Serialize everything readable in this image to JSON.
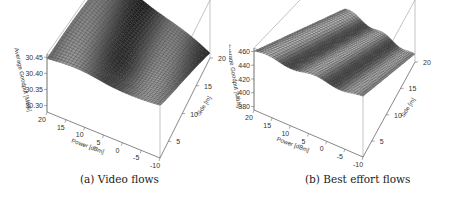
{
  "captions": {
    "a": "(a) Video flows",
    "b": "(b) Best effort flows"
  },
  "chart_data": [
    {
      "type": "surface3d",
      "title": "(a) Video flows",
      "xlabel": "Power [dBm]",
      "ylabel": "Side [m]",
      "zlabel": "Average Goodput [Mb/s]",
      "x_ticks": [
        20,
        15,
        10,
        5,
        0,
        -5,
        -10
      ],
      "y_ticks": [
        5,
        10,
        15,
        20
      ],
      "z_ticks": [
        30.3,
        30.35,
        30.4,
        30.45
      ],
      "xlim": [
        -10,
        20
      ],
      "ylim": [
        2,
        20
      ],
      "zlim": [
        30.28,
        30.46
      ],
      "description": "Surface is near 30.45 at high power / small side, with a wavy depression in the middle, dropping toward ~30.28 at low power and large side."
    },
    {
      "type": "surface3d",
      "title": "(b) Best effort flows",
      "xlabel": "Power [dBm]",
      "ylabel": "Side [m]",
      "zlabel": "Average Goodput [Mb/s]",
      "x_ticks": [
        20,
        15,
        10,
        5,
        0,
        -5,
        -10
      ],
      "y_ticks": [
        5,
        10,
        15,
        20
      ],
      "z_ticks": [
        380,
        400,
        420,
        440,
        460
      ],
      "xlim": [
        -10,
        20
      ],
      "ylim": [
        2,
        20
      ],
      "zlim": [
        375,
        465
      ],
      "description": "Tilted plane-like surface rising from ~380 at large side to ~460 at small side, with periodic ripples along the power axis."
    }
  ]
}
